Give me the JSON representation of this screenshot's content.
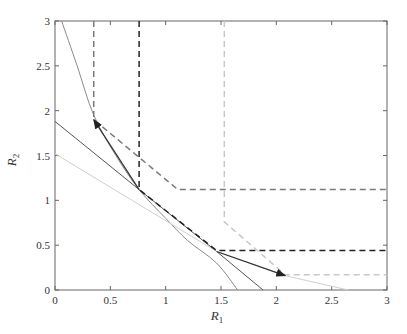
{
  "chart_data": {
    "type": "line",
    "title": "",
    "xlabel": "R1",
    "ylabel": "R2",
    "xlim": [
      0,
      3
    ],
    "ylim": [
      0,
      3
    ],
    "xticks": [
      "0",
      "0.5",
      "1",
      "1.5",
      "2",
      "2.5",
      "3"
    ],
    "yticks": [
      "0",
      "0.5",
      "1",
      "1.5",
      "2",
      "2.5",
      "3"
    ],
    "grid": false,
    "legend": null,
    "series": [
      {
        "name": "boundary-curve-gray",
        "style": "solid",
        "color": "#8a8a8a",
        "points": [
          [
            0.06,
            3.0
          ],
          [
            0.2,
            2.5
          ],
          [
            0.35,
            1.95
          ],
          [
            0.55,
            1.5
          ],
          [
            0.76,
            1.12
          ],
          [
            1.0,
            0.8
          ],
          [
            1.2,
            0.55
          ],
          [
            1.46,
            0.3
          ],
          [
            1.65,
            0.0
          ]
        ]
      },
      {
        "name": "tangent-line-dark",
        "style": "solid",
        "color": "#555555",
        "points": [
          [
            0.0,
            1.88
          ],
          [
            0.76,
            1.12
          ],
          [
            1.46,
            0.43
          ],
          [
            1.88,
            0.0
          ]
        ]
      },
      {
        "name": "tangent-line-light",
        "style": "solid",
        "color": "#cfcfcf",
        "points": [
          [
            0.0,
            1.52
          ],
          [
            1.46,
            0.43
          ],
          [
            2.08,
            0.16
          ],
          [
            2.65,
            0.0
          ]
        ]
      },
      {
        "name": "region-dashed-medium",
        "style": "dashed",
        "color": "#7a7a7a",
        "points": [
          [
            0.35,
            3.0
          ],
          [
            0.35,
            1.9
          ],
          [
            1.11,
            1.12
          ],
          [
            3.0,
            1.12
          ]
        ]
      },
      {
        "name": "region-dashed-dark",
        "style": "dashed",
        "color": "#222222",
        "points": [
          [
            0.76,
            3.0
          ],
          [
            0.76,
            1.12
          ],
          [
            1.46,
            0.44
          ],
          [
            3.0,
            0.44
          ]
        ]
      },
      {
        "name": "region-dashed-light",
        "style": "dashed",
        "color": "#c8c8c8",
        "points": [
          [
            1.53,
            3.0
          ],
          [
            1.53,
            0.76
          ],
          [
            2.08,
            0.17
          ],
          [
            3.0,
            0.17
          ]
        ]
      }
    ],
    "annotations": [
      {
        "type": "arrow",
        "from": [
          0.76,
          1.12
        ],
        "to": [
          0.35,
          1.9
        ],
        "color": "#333333"
      },
      {
        "type": "arrow",
        "from": [
          1.46,
          0.43
        ],
        "to": [
          2.08,
          0.16
        ],
        "color": "#333333"
      }
    ]
  },
  "axes": {
    "xlabel_main": "R",
    "xlabel_sub": "1",
    "ylabel_main": "R",
    "ylabel_sub": "2"
  }
}
